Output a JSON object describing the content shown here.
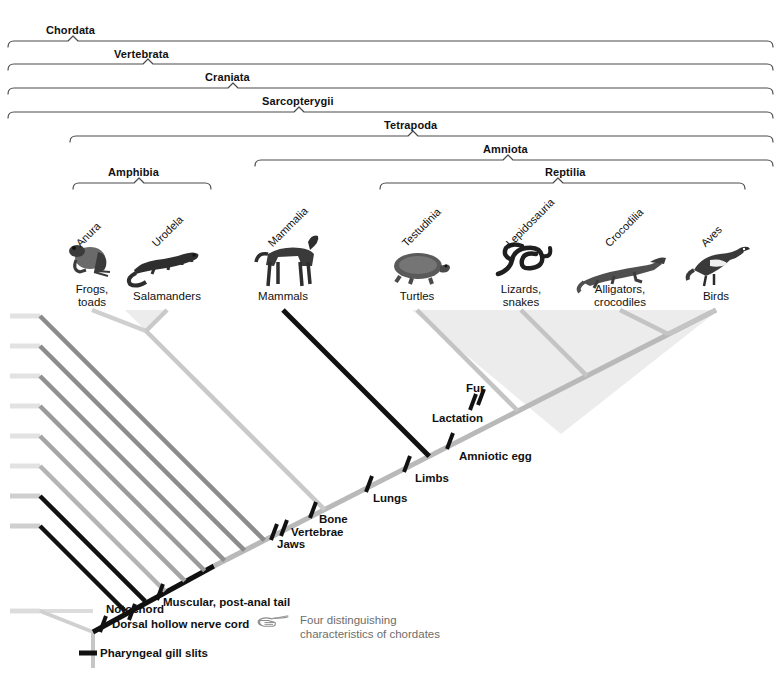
{
  "figure": {
    "type": "cladogram"
  },
  "clades": [
    {
      "id": "chordata",
      "label": "Chordata",
      "label_x": 46,
      "label_y": 24,
      "bracket_x1": 8,
      "bracket_x2": 773,
      "bracket_y": 41,
      "tick_x": 73
    },
    {
      "id": "vertebrata",
      "label": "Vertebrata",
      "label_x": 114,
      "label_y": 48,
      "bracket_x1": 8,
      "bracket_x2": 773,
      "bracket_y": 64,
      "tick_x": 148
    },
    {
      "id": "craniata",
      "label": "Craniata",
      "label_x": 205,
      "label_y": 71,
      "bracket_x1": 8,
      "bracket_x2": 773,
      "bracket_y": 88,
      "tick_x": 233
    },
    {
      "id": "sarcopterygii",
      "label": "Sarcopterygii",
      "label_x": 262,
      "label_y": 95,
      "bracket_x1": 8,
      "bracket_x2": 773,
      "bracket_y": 112,
      "tick_x": 299
    },
    {
      "id": "tetrapoda",
      "label": "Tetrapoda",
      "label_x": 384,
      "label_y": 119,
      "bracket_x1": 70,
      "bracket_x2": 773,
      "bracket_y": 136,
      "tick_x": 413
    },
    {
      "id": "amniota",
      "label": "Amniota",
      "label_x": 483,
      "label_y": 143,
      "bracket_x1": 255,
      "bracket_x2": 773,
      "bracket_y": 160,
      "tick_x": 508
    },
    {
      "id": "amphibia",
      "label": "Amphibia",
      "label_x": 108,
      "label_y": 166,
      "bracket_x1": 73,
      "bracket_x2": 211,
      "bracket_y": 183,
      "tick_x": 139
    },
    {
      "id": "reptilia",
      "label": "Reptilia",
      "label_x": 545,
      "label_y": 166,
      "bracket_x1": 380,
      "bracket_x2": 745,
      "bracket_y": 183,
      "tick_x": 558
    }
  ],
  "taxa": [
    {
      "id": "anura",
      "scientific": "Anura",
      "common": "Frogs,\ntoads",
      "common_line1": "Frogs,",
      "common_line2": "toads",
      "sci_x": 82,
      "sci_y": 237,
      "common_x": 92,
      "common_y": 283,
      "organism": "frog-silhouette",
      "tip_x": 92,
      "tip_y": 310
    },
    {
      "id": "urodela",
      "scientific": "Urodela",
      "common_line1": "Salamanders",
      "common_line2": "",
      "sci_x": 158,
      "sci_y": 237,
      "common_x": 167,
      "common_y": 290,
      "organism": "salamander-silhouette",
      "tip_x": 167,
      "tip_y": 310
    },
    {
      "id": "mammalia",
      "scientific": "Mammalia",
      "common_line1": "Mammals",
      "common_line2": "",
      "sci_x": 274,
      "sci_y": 237,
      "common_x": 283,
      "common_y": 290,
      "organism": "mammal-silhouette",
      "tip_x": 283,
      "tip_y": 310
    },
    {
      "id": "testudinia",
      "scientific": "Testudinia",
      "common_line1": "Turtles",
      "common_line2": "",
      "sci_x": 408,
      "sci_y": 237,
      "common_x": 417,
      "common_y": 290,
      "organism": "turtle-silhouette",
      "tip_x": 417,
      "tip_y": 310
    },
    {
      "id": "lepidosauria",
      "scientific": "Lepidosauria",
      "common_line1": "Lizards,",
      "common_line2": "snakes",
      "sci_x": 512,
      "sci_y": 237,
      "common_x": 521,
      "common_y": 283,
      "organism": "snake-silhouette",
      "tip_x": 521,
      "tip_y": 310
    },
    {
      "id": "crocodilia",
      "scientific": "Crocodilia",
      "common_line1": "Alligators,",
      "common_line2": "crocodiles",
      "sci_x": 611,
      "sci_y": 237,
      "common_x": 620,
      "common_y": 283,
      "organism": "crocodile-silhouette",
      "tip_x": 620,
      "tip_y": 310
    },
    {
      "id": "aves",
      "scientific": "Aves",
      "common_line1": "Birds",
      "common_line2": "",
      "sci_x": 707,
      "sci_y": 237,
      "common_x": 716,
      "common_y": 290,
      "organism": "bird-silhouette",
      "tip_x": 716,
      "tip_y": 310
    }
  ],
  "characters": [
    {
      "id": "pharyngeal-gill-slits",
      "label": "Pharyngeal gill slits",
      "mark_x": 88,
      "mark_y": 653,
      "label_x": 100,
      "label_y": 647,
      "style": "horizontal"
    },
    {
      "id": "dorsal-hollow-nerve-cord",
      "label": "Dorsal hollow nerve cord",
      "mark_x": 103,
      "mark_y": 624,
      "label_x": 112,
      "label_y": 618,
      "style": "diagonal"
    },
    {
      "id": "notochord",
      "label": "Notochord",
      "mark_x": 132,
      "mark_y": 612,
      "label_x": 106,
      "label_y": 603,
      "style": "diagonal"
    },
    {
      "id": "muscular-post-anal-tail",
      "label": "Muscular, post-anal tail",
      "mark_x": 160,
      "mark_y": 592,
      "label_x": 163,
      "label_y": 596,
      "style": "diagonal"
    },
    {
      "id": "jaws",
      "label": "Jaws",
      "mark_x": 274,
      "mark_y": 532,
      "label_x": 277,
      "label_y": 538,
      "style": "diagonal"
    },
    {
      "id": "vertebrae",
      "label": "Vertebrae",
      "mark_x": 284,
      "mark_y": 528,
      "label_x": 291,
      "label_y": 526,
      "style": "diagonal"
    },
    {
      "id": "bone",
      "label": "Bone",
      "mark_x": 313,
      "mark_y": 510,
      "label_x": 319,
      "label_y": 513,
      "style": "diagonal"
    },
    {
      "id": "lungs",
      "label": "Lungs",
      "mark_x": 369,
      "mark_y": 484,
      "label_x": 373,
      "label_y": 492,
      "style": "diagonal"
    },
    {
      "id": "limbs",
      "label": "Limbs",
      "mark_x": 407,
      "mark_y": 464,
      "label_x": 415,
      "label_y": 472,
      "style": "diagonal"
    },
    {
      "id": "amniotic-egg",
      "label": "Amniotic egg",
      "mark_x": 450,
      "mark_y": 441,
      "label_x": 459,
      "label_y": 450,
      "style": "diagonal"
    },
    {
      "id": "lactation",
      "label": "Lactation",
      "mark_x": 473,
      "mark_y": 402,
      "label_x": 432,
      "label_y": 412,
      "style": "diagonal"
    },
    {
      "id": "fur",
      "label": "Fur",
      "mark_x": 481,
      "mark_y": 397,
      "label_x": 466,
      "label_y": 382,
      "style": "diagonal"
    }
  ],
  "note": {
    "icon": "pointing-hand-icon",
    "line1": "Four distinguishing",
    "line2": "characteristics of chordates",
    "icon_x": 258,
    "icon_y": 617,
    "text_x": 300,
    "text_y": 613
  },
  "colors": {
    "background": "#ffffff",
    "text": "#111111",
    "bracket": "#4a4a4a",
    "note_text": "#6d6d6d",
    "branch_black": "#111111",
    "branch_dark_gray": "#8a8a8a",
    "branch_mid_gray": "#a3a3a3",
    "branch_light_gray": "#c4c4c4",
    "branch_pale_gray": "#d8d8d8",
    "clade_shade": "#ececec"
  }
}
